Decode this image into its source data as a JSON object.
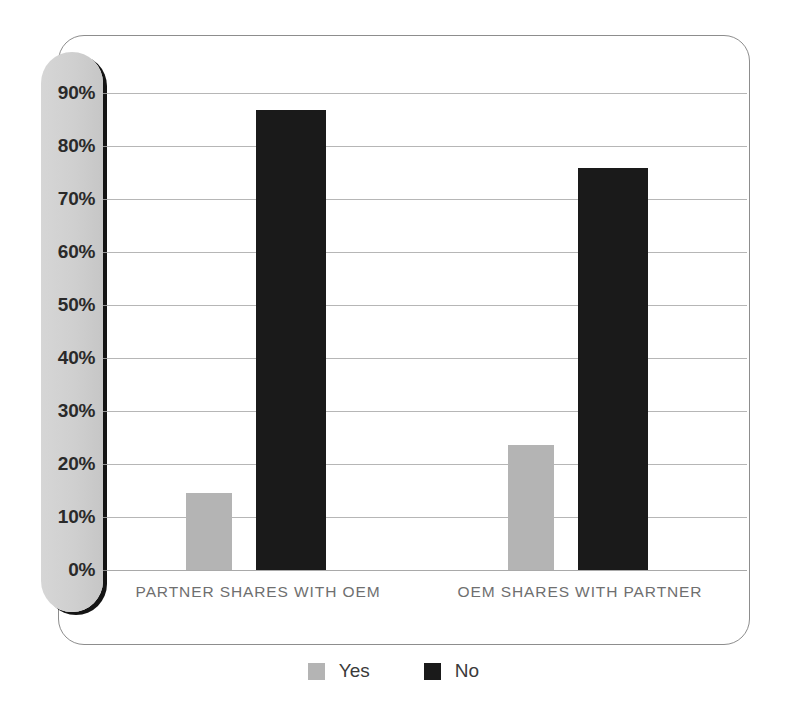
{
  "chart_data": {
    "type": "bar",
    "title": "",
    "subtitle": "",
    "xlabel": "",
    "ylabel": "",
    "categories": [
      "PARTNER SHARES WITH OEM",
      "OEM SHARES WITH PARTNER"
    ],
    "series": [
      {
        "name": "Yes",
        "color": "#b4b4b4",
        "values": [
          14.6,
          23.6
        ]
      },
      {
        "name": "No",
        "color": "#1a1a1a",
        "values": [
          86.8,
          75.8
        ]
      }
    ],
    "ylim": [
      0,
      90
    ],
    "ytick_values": [
      0,
      10,
      20,
      30,
      40,
      50,
      60,
      70,
      80,
      90
    ],
    "ytick_labels": [
      "0%",
      "10%",
      "20%",
      "30%",
      "40%",
      "50%",
      "60%",
      "70%",
      "80%",
      "90%"
    ],
    "grid": true,
    "legend_position": "bottom",
    "legend": [
      {
        "label": "Yes",
        "color": "#b4b4b4",
        "swatch": "square-swatch"
      },
      {
        "label": "No",
        "color": "#1a1a1a",
        "swatch": "square-swatch"
      }
    ]
  },
  "colors": {
    "bar_yes": "#b4b4b4",
    "bar_no": "#1a1a1a",
    "gridline": "#a9a9a9",
    "frame_border": "#8d8d8d",
    "axis_panel": "#cfcfcf",
    "axis_panel_shadow": "#141414",
    "tick_text": "#2a2a2a",
    "category_text": "#6f6f6f",
    "legend_text": "#3a3a3a",
    "background": "#ffffff"
  }
}
